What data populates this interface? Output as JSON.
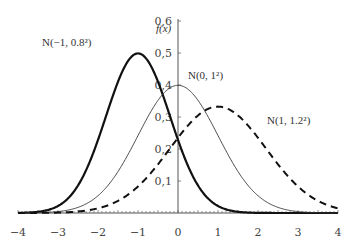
{
  "chart_data": {
    "type": "line",
    "title": "",
    "xlabel": "",
    "ylabel": "f(x)",
    "xlim": [
      -4,
      4
    ],
    "ylim": [
      0,
      0.6
    ],
    "x_ticks": [
      "−4",
      "−3",
      "−2",
      "−1",
      "0",
      "1",
      "2",
      "3",
      "4"
    ],
    "y_ticks": [
      "0.1",
      "0.2",
      "0.3",
      "0.4",
      "0.5",
      "0.6"
    ],
    "grid": false,
    "series": [
      {
        "name": "N(−1, 0.8²)",
        "mu": -1,
        "sigma": 0.8,
        "style": "thick-solid",
        "peak": 0.499
      },
      {
        "name": "N(0, 1²)",
        "mu": 0,
        "sigma": 1,
        "style": "thin-solid",
        "peak": 0.399
      },
      {
        "name": "N(1, 1.2²)",
        "mu": 1,
        "sigma": 1.2,
        "style": "dashed",
        "peak": 0.332
      }
    ]
  },
  "labels": {
    "ylabel": "f(x)",
    "s1": "N(−1, 0.8²)",
    "s2": "N(0, 1²)",
    "s3": "N(1, 1.2²)"
  }
}
